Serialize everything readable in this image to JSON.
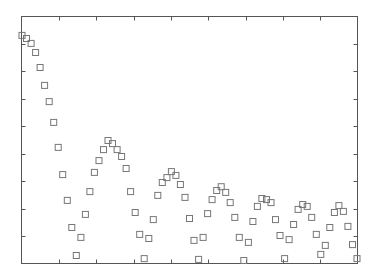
{
  "chart_data": {
    "type": "scatter",
    "title": "",
    "xlabel": "",
    "ylabel": "",
    "xlim": [
      0,
      74
    ],
    "ylim": [
      0,
      9
    ],
    "grid": false,
    "legend": null,
    "marker": "hollow-square",
    "tick_labels_visible": false,
    "x_ticks_count": 8,
    "y_ticks_count": 8,
    "colors": {
      "frame": "#555555",
      "marker": "#777777",
      "background": "#ffffff"
    },
    "series": [
      {
        "name": "series-1",
        "x": [
          0,
          1,
          2,
          3,
          4,
          5,
          6,
          7,
          8,
          9,
          10,
          11,
          12,
          13,
          14,
          15,
          16,
          17,
          18,
          19,
          20,
          21,
          22,
          23,
          24,
          25,
          26,
          27,
          28,
          29,
          30,
          31,
          32,
          33,
          34,
          35,
          36,
          37,
          38,
          39,
          40,
          41,
          42,
          43,
          44,
          45,
          46,
          47,
          48,
          49,
          50,
          51,
          52,
          53,
          54,
          55,
          56,
          57,
          58,
          59,
          60,
          61,
          62,
          63,
          64,
          65,
          66,
          67,
          68,
          69,
          70,
          71,
          72,
          73,
          74
        ],
        "values": [
          8.31,
          8.2,
          8.02,
          7.69,
          7.14,
          6.49,
          5.9,
          5.14,
          4.23,
          3.24,
          2.3,
          1.31,
          0.29,
          0.95,
          1.79,
          2.62,
          3.32,
          3.75,
          4.15,
          4.48,
          4.37,
          4.15,
          3.9,
          3.46,
          2.62,
          1.86,
          1.06,
          0.18,
          0.91,
          1.6,
          2.48,
          2.95,
          3.13,
          3.35,
          3.21,
          2.88,
          2.41,
          1.64,
          0.84,
          0.15,
          0.95,
          1.82,
          2.33,
          2.66,
          2.8,
          2.59,
          2.22,
          1.68,
          0.95,
          0.11,
          0.77,
          1.53,
          2.08,
          2.37,
          2.33,
          2.22,
          1.6,
          1.02,
          0.18,
          0.87,
          1.42,
          1.97,
          2.15,
          2.08,
          1.68,
          1.06,
          0.33,
          0.66,
          1.31,
          1.86,
          2.11,
          1.9,
          1.35,
          0.69,
          0.18
        ]
      }
    ]
  }
}
